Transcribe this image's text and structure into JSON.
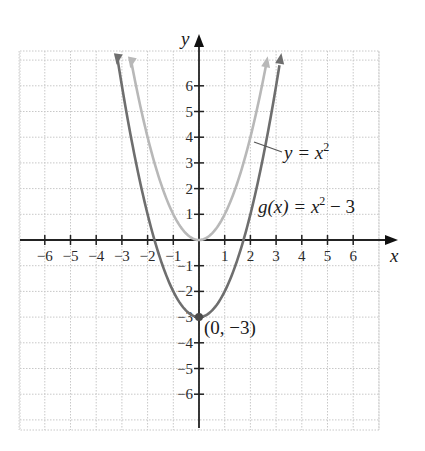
{
  "chart_data": {
    "type": "line",
    "title": "",
    "xlabel": "x",
    "ylabel": "y",
    "xlim": [
      -7,
      7
    ],
    "ylim": [
      -7,
      7
    ],
    "grid": true,
    "x_ticks": [
      -6,
      -5,
      -4,
      -3,
      -2,
      -1,
      1,
      2,
      3,
      4,
      5,
      6
    ],
    "y_ticks": [
      -6,
      -5,
      -4,
      -3,
      -2,
      -1,
      1,
      2,
      3,
      4,
      5,
      6
    ],
    "series": [
      {
        "name": "y = x^2",
        "color": "#b8b8b8",
        "x": [
          -2.6,
          -2,
          -1,
          0,
          1,
          2,
          2.6
        ],
        "values": [
          6.76,
          4,
          1,
          0,
          1,
          4,
          6.76
        ]
      },
      {
        "name": "g(x) = x^2 - 3",
        "color": "#6e6e6e",
        "x": [
          -3.15,
          -3,
          -2,
          -1,
          0,
          1,
          2,
          3,
          3.15
        ],
        "values": [
          6.92,
          6,
          1,
          -2,
          -3,
          -2,
          1,
          6,
          6.92
        ]
      }
    ],
    "annotations": [
      {
        "text": "(0, −3)",
        "x": 0,
        "y": -3,
        "marker": "point"
      },
      {
        "text": "y = x²",
        "points_to": "y = x^2"
      },
      {
        "text": "g(x) = x² − 3",
        "points_to": "g(x) = x^2 - 3"
      }
    ]
  },
  "labels": {
    "x_axis": "x",
    "y_axis": "y",
    "curve1_lhs": "y = x",
    "curve1_exp": "2",
    "curve2_lhs": "g(x) = x",
    "curve2_exp": "2",
    "curve2_rhs": " − 3",
    "vertex": "(0, −3)"
  },
  "x_tick_labels": [
    "−6",
    "−5",
    "−4",
    "−3",
    "−2",
    "−1",
    "1",
    "2",
    "3",
    "4",
    "5",
    "6"
  ],
  "y_tick_labels": [
    "6",
    "5",
    "4",
    "3",
    "2",
    "1",
    "−1",
    "−2",
    "−3",
    "−4",
    "−5",
    "−6"
  ]
}
